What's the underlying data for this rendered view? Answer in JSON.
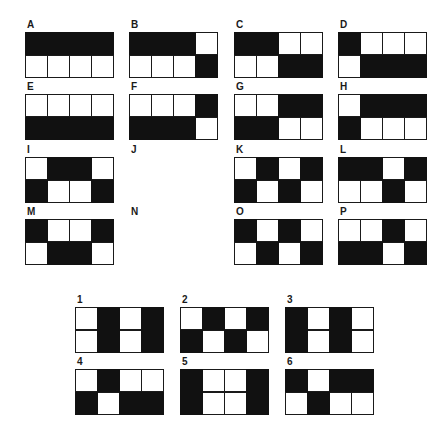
{
  "colors": {
    "filled": "#111111",
    "empty": "#ffffff",
    "border": "#1a1a1a"
  },
  "matrix": [
    {
      "label": "A",
      "x": 25,
      "y": 32,
      "cells": [
        [
          1,
          1,
          1,
          1
        ],
        [
          0,
          0,
          0,
          0
        ]
      ]
    },
    {
      "label": "B",
      "x": 129,
      "y": 32,
      "cells": [
        [
          1,
          1,
          1,
          0
        ],
        [
          0,
          0,
          0,
          1
        ]
      ]
    },
    {
      "label": "C",
      "x": 234,
      "y": 32,
      "cells": [
        [
          1,
          1,
          0,
          0
        ],
        [
          0,
          0,
          1,
          1
        ]
      ]
    },
    {
      "label": "D",
      "x": 338,
      "y": 32,
      "cells": [
        [
          1,
          0,
          0,
          0
        ],
        [
          0,
          1,
          1,
          1
        ]
      ]
    },
    {
      "label": "E",
      "x": 25,
      "y": 94,
      "cells": [
        [
          0,
          0,
          0,
          0
        ],
        [
          1,
          1,
          1,
          1
        ]
      ]
    },
    {
      "label": "F",
      "x": 129,
      "y": 94,
      "cells": [
        [
          0,
          0,
          0,
          1
        ],
        [
          1,
          1,
          1,
          0
        ]
      ]
    },
    {
      "label": "G",
      "x": 234,
      "y": 94,
      "cells": [
        [
          0,
          0,
          1,
          1
        ],
        [
          1,
          1,
          0,
          0
        ]
      ]
    },
    {
      "label": "H",
      "x": 338,
      "y": 94,
      "cells": [
        [
          0,
          1,
          1,
          1
        ],
        [
          1,
          0,
          0,
          0
        ]
      ]
    },
    {
      "label": "I",
      "x": 25,
      "y": 157,
      "cells": [
        [
          0,
          1,
          1,
          0
        ],
        [
          1,
          0,
          0,
          1
        ]
      ]
    },
    {
      "label": "J",
      "x": 129,
      "y": 157,
      "cells": null
    },
    {
      "label": "K",
      "x": 234,
      "y": 157,
      "cells": [
        [
          0,
          1,
          0,
          1
        ],
        [
          1,
          0,
          1,
          0
        ]
      ]
    },
    {
      "label": "L",
      "x": 338,
      "y": 157,
      "cells": [
        [
          1,
          1,
          0,
          1
        ],
        [
          0,
          0,
          1,
          0
        ]
      ]
    },
    {
      "label": "M",
      "x": 25,
      "y": 219,
      "cells": [
        [
          1,
          0,
          0,
          1
        ],
        [
          0,
          1,
          1,
          0
        ]
      ]
    },
    {
      "label": "N",
      "x": 129,
      "y": 219,
      "cells": null
    },
    {
      "label": "O",
      "x": 234,
      "y": 219,
      "cells": [
        [
          1,
          0,
          1,
          0
        ],
        [
          0,
          1,
          0,
          1
        ]
      ]
    },
    {
      "label": "P",
      "x": 338,
      "y": 219,
      "cells": [
        [
          0,
          0,
          1,
          0
        ],
        [
          1,
          1,
          0,
          1
        ]
      ]
    }
  ],
  "options": [
    {
      "label": "1",
      "x": 75,
      "y": 307,
      "cells": [
        [
          0,
          1,
          0,
          1
        ],
        [
          0,
          1,
          0,
          1
        ]
      ]
    },
    {
      "label": "2",
      "x": 180,
      "y": 307,
      "cells": [
        [
          0,
          1,
          0,
          1
        ],
        [
          1,
          0,
          1,
          0
        ]
      ]
    },
    {
      "label": "3",
      "x": 285,
      "y": 307,
      "cells": [
        [
          1,
          0,
          1,
          0
        ],
        [
          1,
          0,
          1,
          0
        ]
      ]
    },
    {
      "label": "4",
      "x": 75,
      "y": 369,
      "cells": [
        [
          0,
          1,
          0,
          0
        ],
        [
          1,
          0,
          1,
          1
        ]
      ]
    },
    {
      "label": "5",
      "x": 180,
      "y": 369,
      "cells": [
        [
          1,
          0,
          0,
          1
        ],
        [
          1,
          0,
          0,
          1
        ]
      ]
    },
    {
      "label": "6",
      "x": 285,
      "y": 369,
      "cells": [
        [
          1,
          0,
          1,
          1
        ],
        [
          0,
          1,
          0,
          0
        ]
      ]
    }
  ]
}
